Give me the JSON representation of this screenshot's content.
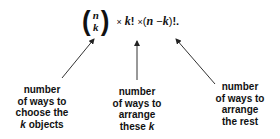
{
  "formula": {
    "binom_top": "n",
    "binom_bottom": "k",
    "times1": "×",
    "k_fact": "k",
    "fact1": "!",
    "times2": "×",
    "open": "(",
    "n": "n",
    "minus": "−",
    "k": "k",
    "close": ")",
    "tail": "!."
  },
  "labels": {
    "left": {
      "lines": [
        "number",
        "of ways to",
        "choose the"
      ],
      "last_var": "k",
      "last_rest": " objects"
    },
    "middle": {
      "lines": [
        "number",
        "of ways to",
        "arrange"
      ],
      "last_pre": "these ",
      "last_var": "k"
    },
    "right": {
      "lines": [
        "number",
        "of ways to",
        "arrange",
        "the rest"
      ]
    }
  },
  "colors": {
    "ink": "#111111",
    "arrow": "#333333"
  }
}
